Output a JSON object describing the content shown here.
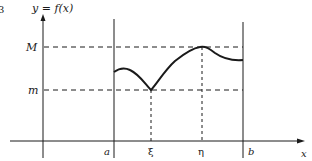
{
  "figure": {
    "number_fragment": "3",
    "y_axis_label": "y = f(x)",
    "x_axis_label": "x",
    "labels": {
      "M": "M",
      "m": "m",
      "a": "a",
      "b": "b",
      "xi": "ξ",
      "eta": "η"
    },
    "colors": {
      "ink": "#1a1a1a",
      "background": "#ffffff"
    }
  }
}
